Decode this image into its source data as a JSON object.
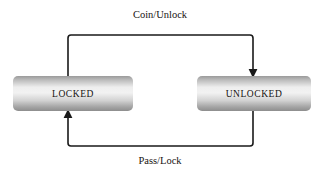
{
  "diagram": {
    "background_color": "#ffffff",
    "states": [
      {
        "id": "locked",
        "label": "LOCKED",
        "x": 13,
        "y": 76,
        "width": 120,
        "height": 35,
        "center_x": 73,
        "center_y": 93.5,
        "corner_radius": 5,
        "fill_top": "#9a9a9a",
        "fill_mid": "#f0f0f0",
        "fill_bottom": "#8e8e8e",
        "text_color": "#15110f"
      },
      {
        "id": "unlocked",
        "label": "UNLOCKED",
        "x": 197,
        "y": 76,
        "width": 114,
        "height": 35,
        "center_x": 254,
        "center_y": 93.5,
        "corner_radius": 5,
        "fill_top": "#9a9a9a",
        "fill_mid": "#f0f0f0",
        "fill_bottom": "#8e8e8e",
        "text_color": "#15110f"
      }
    ],
    "transitions": [
      {
        "id": "coin-unlock",
        "label": "Coin/Unlock",
        "from": "locked",
        "to": "unlocked",
        "label_x": 160,
        "label_y": 16,
        "path": "M 68 76 L 68 38 Q 68 35 71 35 L 250 35 Q 253 35 253 38 L 253 71",
        "arrow_x": 253,
        "arrow_y": 76,
        "arrow_direction": "down",
        "stroke_color": "#1a1a1a"
      },
      {
        "id": "pass-lock",
        "label": "Pass/Lock",
        "from": "unlocked",
        "to": "locked",
        "label_x": 160,
        "label_y": 162,
        "path": "M 253 111 L 253 143 Q 253 146 250 146 L 71 146 Q 68 146 68 143 L 68 116",
        "arrow_x": 68,
        "arrow_y": 111,
        "arrow_direction": "up",
        "stroke_color": "#1a1a1a"
      }
    ]
  }
}
